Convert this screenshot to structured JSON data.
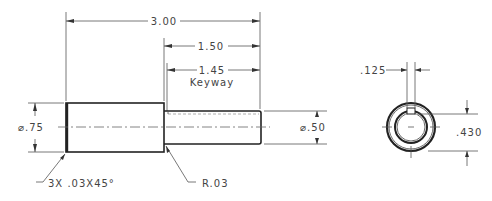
{
  "drawing": {
    "side_view": {
      "overall_length": "3.00",
      "small_dia_length": "1.50",
      "keyway_length": "1.45",
      "keyway_label": "Keyway",
      "large_diameter": "⌀.75",
      "small_diameter": "⌀.50",
      "chamfer_note": "3X .03X45°",
      "fillet_note": "R.03"
    },
    "end_view": {
      "keyway_width": ".125",
      "keyway_depth": ".430"
    }
  }
}
